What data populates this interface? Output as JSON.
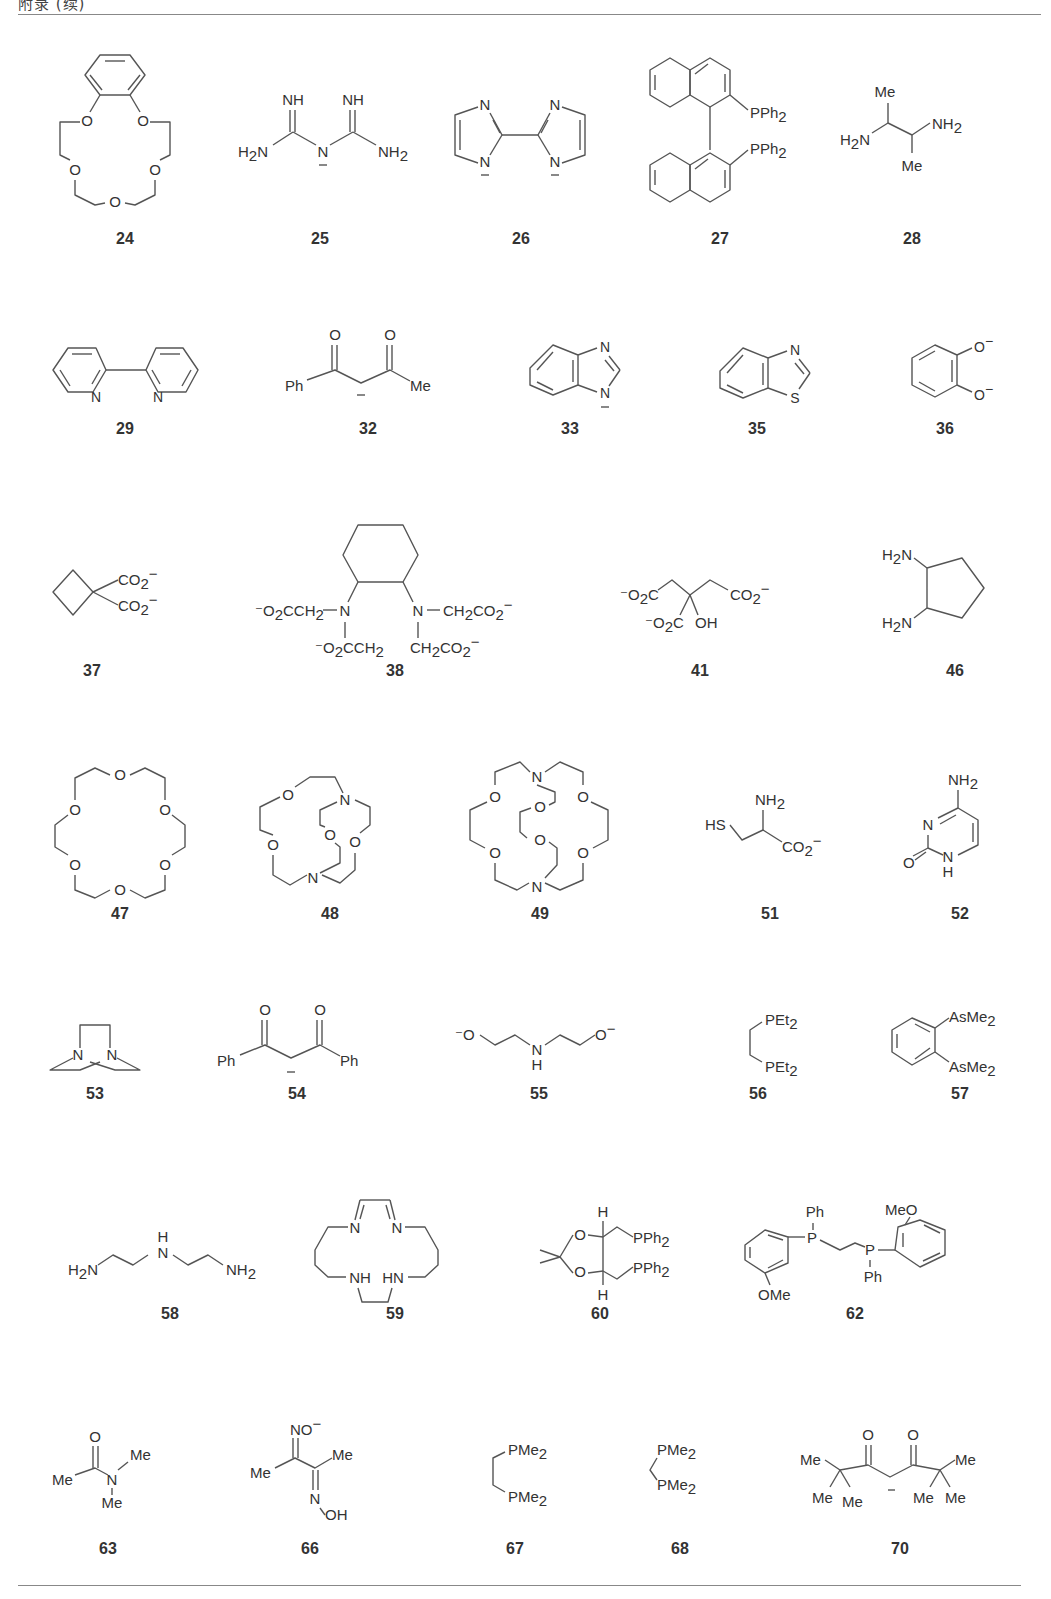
{
  "page": {
    "header_fragment": "附录 (续)",
    "figure_type": "ligand structure table"
  },
  "compounds": [
    {
      "id": "24",
      "name": "benzo-15-crown-5",
      "labels": [
        "O",
        "O",
        "O",
        "O",
        "O"
      ]
    },
    {
      "id": "25",
      "name": "biguanide anion",
      "labels": [
        "NH",
        "NH",
        "H2N",
        "N",
        "NH2"
      ]
    },
    {
      "id": "26",
      "name": "2,2'-biimidazolate",
      "labels": [
        "N",
        "N",
        "N",
        "N"
      ]
    },
    {
      "id": "27",
      "name": "BINAP",
      "labels": [
        "PPh2",
        "PPh2"
      ]
    },
    {
      "id": "28",
      "name": "2,3-butanediamine",
      "labels": [
        "Me",
        "H2N",
        "NH2",
        "Me"
      ]
    },
    {
      "id": "29",
      "name": "2,2'-bipyridine",
      "labels": [
        "N",
        "N"
      ]
    },
    {
      "id": "32",
      "name": "benzoylacetonate",
      "labels": [
        "O",
        "O",
        "Ph",
        "Me"
      ]
    },
    {
      "id": "33",
      "name": "benzimidazolate",
      "labels": [
        "N",
        "N"
      ]
    },
    {
      "id": "35",
      "name": "benzothiazole",
      "labels": [
        "N",
        "S"
      ]
    },
    {
      "id": "36",
      "name": "catecholate",
      "labels": [
        "O⁻",
        "O⁻"
      ]
    },
    {
      "id": "37",
      "name": "cyclobutane-1,1-dicarboxylate",
      "labels": [
        "CO2⁻",
        "CO2⁻"
      ]
    },
    {
      "id": "38",
      "name": "CDTA",
      "labels": [
        "⁻O2CCH2",
        "N",
        "N",
        "CH2CO2⁻",
        "⁻O2CCH2",
        "CH2CO2⁻"
      ]
    },
    {
      "id": "41",
      "name": "citrate",
      "labels": [
        "⁻O2C",
        "CO2⁻",
        "⁻O2C",
        "OH"
      ]
    },
    {
      "id": "46",
      "name": "1,2-diaminocyclopentane",
      "labels": [
        "H2N",
        "H2N"
      ]
    },
    {
      "id": "47",
      "name": "18-crown-6",
      "labels": [
        "O",
        "O",
        "O",
        "O",
        "O",
        "O"
      ]
    },
    {
      "id": "48",
      "name": "cryptand[2.1.1]",
      "labels": [
        "O",
        "N",
        "O",
        "O",
        "O",
        "N"
      ]
    },
    {
      "id": "49",
      "name": "cryptand[2.2.2]",
      "labels": [
        "N",
        "O",
        "O",
        "O",
        "O",
        "O",
        "O",
        "N"
      ]
    },
    {
      "id": "51",
      "name": "cysteinate",
      "labels": [
        "NH2",
        "HS",
        "CO2⁻"
      ]
    },
    {
      "id": "52",
      "name": "cytosine",
      "labels": [
        "NH2",
        "N",
        "O",
        "N",
        "H"
      ]
    },
    {
      "id": "53",
      "name": "DABCO-type diamine",
      "labels": [
        "N",
        "N"
      ]
    },
    {
      "id": "54",
      "name": "dibenzoylmethanate",
      "labels": [
        "O",
        "O",
        "Ph",
        "Ph"
      ]
    },
    {
      "id": "55",
      "name": "diethanolamine dianion",
      "labels": [
        "⁻O",
        "N",
        "H",
        "O⁻"
      ]
    },
    {
      "id": "56",
      "name": "depe",
      "labels": [
        "PEt2",
        "PEt2"
      ]
    },
    {
      "id": "57",
      "name": "diars",
      "labels": [
        "AsMe2",
        "AsMe2"
      ]
    },
    {
      "id": "58",
      "name": "diethylenetriamine",
      "labels": [
        "H2N",
        "H",
        "N",
        "NH2"
      ]
    },
    {
      "id": "59",
      "name": "tetraaza macrocycle",
      "labels": [
        "N",
        "N",
        "NH",
        "HN"
      ]
    },
    {
      "id": "60",
      "name": "DIOP",
      "labels": [
        "H",
        "O",
        "PPh2",
        "O",
        "PPh2",
        "H"
      ]
    },
    {
      "id": "62",
      "name": "DIPAMP",
      "labels": [
        "Ph",
        "MeO",
        "P",
        "P",
        "OMe",
        "Ph"
      ]
    },
    {
      "id": "63",
      "name": "N,N-dimethylacetamide",
      "labels": [
        "O",
        "Me",
        "N",
        "Me",
        "Me"
      ]
    },
    {
      "id": "66",
      "name": "dimethylglyoximate",
      "labels": [
        "NO⁻",
        "Me",
        "Me",
        "N",
        "OH"
      ]
    },
    {
      "id": "67",
      "name": "dmpe",
      "labels": [
        "PMe2",
        "PMe2"
      ]
    },
    {
      "id": "68",
      "name": "dmpm",
      "labels": [
        "PMe2",
        "PMe2"
      ]
    },
    {
      "id": "70",
      "name": "dipivaloylmethanate",
      "labels": [
        "O",
        "O",
        "Me",
        "Me",
        "Me",
        "Me",
        "Me",
        "Me"
      ]
    }
  ]
}
